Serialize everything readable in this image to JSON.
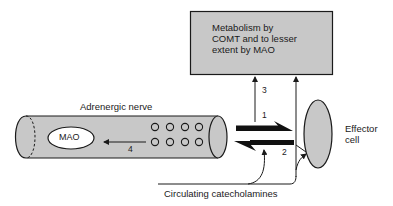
{
  "diagram": {
    "metabolism_box": {
      "lines": [
        "Metabolism by",
        "COMT and to lesser",
        "extent by MAO"
      ]
    },
    "nerve": {
      "label": "Adrenergic nerve",
      "enzyme_label": "MAO",
      "vesicle_rows": 2,
      "vesicles_per_row": 4
    },
    "effector": {
      "lines": [
        "Effector",
        "cell"
      ]
    },
    "circulating_label": "Circulating catecholamines",
    "pathways": [
      {
        "number": "1",
        "description": "release from nerve to effector cell"
      },
      {
        "number": "2",
        "description": "reuptake into nerve"
      },
      {
        "number": "3",
        "description": "to metabolism"
      },
      {
        "number": "4",
        "description": "to intraneuronal MAO"
      }
    ],
    "colors": {
      "fill_gray": "#c8c8c8",
      "stroke": "#1a1a1a",
      "background": "#ffffff"
    }
  }
}
